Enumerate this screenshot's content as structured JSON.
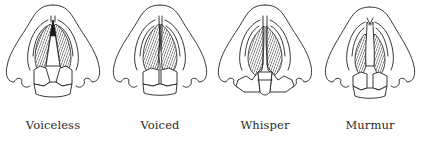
{
  "figure": {
    "panels": [
      {
        "id": "voiceless",
        "label": "Voiceless",
        "glottis": "wide-open",
        "arytenoids": "apart"
      },
      {
        "id": "voiced",
        "label": "Voiced",
        "glottis": "closed-vibrating",
        "arytenoids": "together"
      },
      {
        "id": "whisper",
        "label": "Whisper",
        "glottis": "narrow-posterior-gap",
        "arytenoids": "apart-posterior"
      },
      {
        "id": "murmur",
        "label": "Murmur",
        "glottis": "partly-open",
        "arytenoids": "slightly-apart"
      }
    ]
  },
  "colors": {
    "line": "#222222",
    "background": "#ffffff",
    "label": "#2a2a2a"
  }
}
